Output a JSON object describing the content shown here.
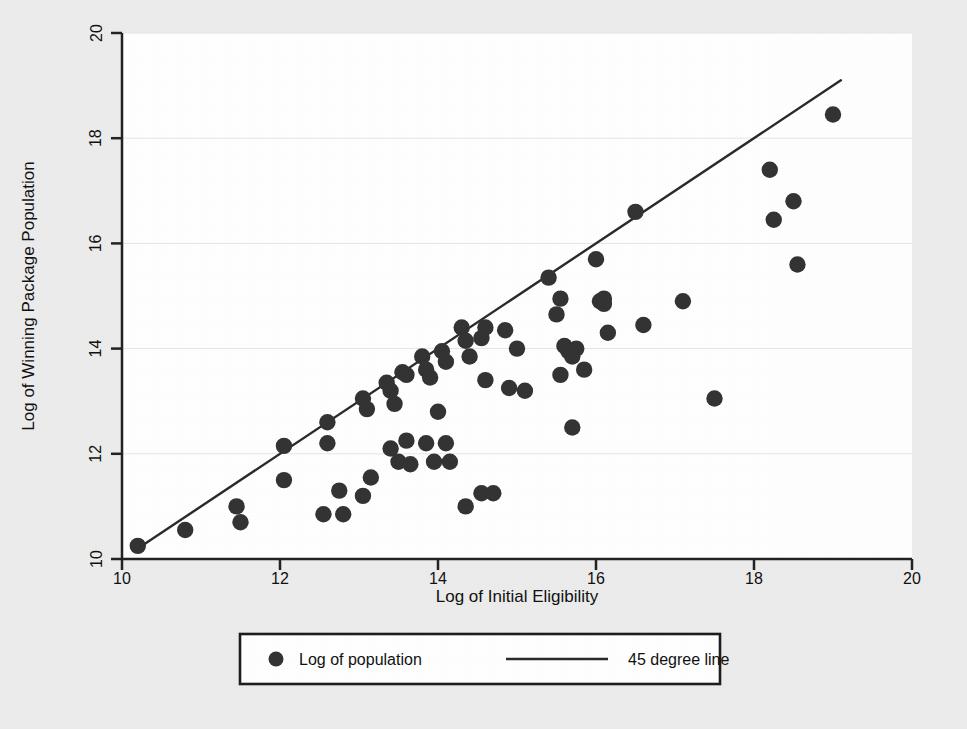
{
  "figure": {
    "background_color": "#ececec",
    "plot_background_color": "#ffffff",
    "ink_color": "#2a2a2a",
    "grid_color": "#e3e3e3"
  },
  "chart_data": {
    "type": "scatter",
    "title": "",
    "xlabel": "Log of Initial Eligibility",
    "ylabel": "Log of Winning Package Population",
    "xlim": [
      10,
      20
    ],
    "ylim": [
      10,
      20
    ],
    "xticks": [
      10,
      12,
      14,
      16,
      18,
      20
    ],
    "yticks": [
      10,
      12,
      14,
      16,
      18,
      20
    ],
    "xtick_labels": [
      "10",
      "12",
      "14",
      "16",
      "18",
      "20"
    ],
    "ytick_labels": [
      "10",
      "12",
      "14",
      "16",
      "18",
      "20"
    ],
    "grid": "horizontal",
    "legend_position": "below-axes",
    "series": [
      {
        "name": "Log of population",
        "marker": "filled-circle",
        "marker_color": "#333333",
        "points": [
          [
            10.2,
            10.25
          ],
          [
            10.8,
            10.55
          ],
          [
            11.45,
            11.0
          ],
          [
            11.5,
            10.7
          ],
          [
            12.05,
            12.15
          ],
          [
            12.05,
            11.5
          ],
          [
            12.6,
            12.6
          ],
          [
            12.6,
            12.2
          ],
          [
            12.55,
            10.85
          ],
          [
            12.75,
            11.3
          ],
          [
            12.8,
            10.85
          ],
          [
            13.05,
            13.05
          ],
          [
            13.1,
            12.85
          ],
          [
            13.15,
            11.55
          ],
          [
            13.05,
            11.2
          ],
          [
            13.35,
            13.35
          ],
          [
            13.4,
            13.2
          ],
          [
            13.45,
            12.95
          ],
          [
            13.4,
            12.1
          ],
          [
            13.5,
            11.85
          ],
          [
            13.55,
            13.55
          ],
          [
            13.6,
            13.5
          ],
          [
            13.6,
            12.25
          ],
          [
            13.65,
            11.8
          ],
          [
            13.8,
            13.85
          ],
          [
            13.85,
            13.6
          ],
          [
            13.9,
            13.45
          ],
          [
            13.85,
            12.2
          ],
          [
            13.95,
            11.85
          ],
          [
            14.0,
            12.8
          ],
          [
            14.05,
            13.95
          ],
          [
            14.1,
            13.75
          ],
          [
            14.1,
            12.2
          ],
          [
            14.15,
            11.85
          ],
          [
            14.3,
            14.4
          ],
          [
            14.35,
            14.15
          ],
          [
            14.4,
            13.85
          ],
          [
            14.35,
            11.0
          ],
          [
            14.55,
            14.2
          ],
          [
            14.6,
            14.4
          ],
          [
            14.6,
            13.4
          ],
          [
            14.55,
            11.25
          ],
          [
            14.7,
            11.25
          ],
          [
            14.85,
            14.35
          ],
          [
            14.9,
            13.25
          ],
          [
            15.0,
            14.0
          ],
          [
            15.1,
            13.2
          ],
          [
            15.4,
            15.35
          ],
          [
            15.5,
            14.65
          ],
          [
            15.55,
            14.95
          ],
          [
            15.55,
            13.5
          ],
          [
            15.6,
            14.05
          ],
          [
            15.65,
            13.95
          ],
          [
            15.7,
            13.85
          ],
          [
            15.75,
            14.0
          ],
          [
            15.7,
            12.5
          ],
          [
            15.85,
            13.6
          ],
          [
            16.0,
            15.7
          ],
          [
            16.05,
            14.9
          ],
          [
            16.1,
            14.85
          ],
          [
            16.1,
            14.95
          ],
          [
            16.15,
            14.3
          ],
          [
            16.5,
            16.6
          ],
          [
            16.6,
            14.45
          ],
          [
            17.1,
            14.9
          ],
          [
            17.5,
            13.05
          ],
          [
            18.2,
            17.4
          ],
          [
            18.25,
            16.45
          ],
          [
            18.5,
            16.8
          ],
          [
            18.55,
            15.6
          ],
          [
            19.0,
            18.45
          ]
        ]
      },
      {
        "name": "45 degree line",
        "type": "line",
        "line_color": "#2a2a2a",
        "from": [
          10.2,
          10.2
        ],
        "to": [
          19.1,
          19.1
        ]
      }
    ]
  },
  "legend": {
    "items": [
      {
        "label": "Log of population",
        "symbol": "filled-circle"
      },
      {
        "label": "45 degree line",
        "symbol": "line-segment"
      }
    ]
  }
}
